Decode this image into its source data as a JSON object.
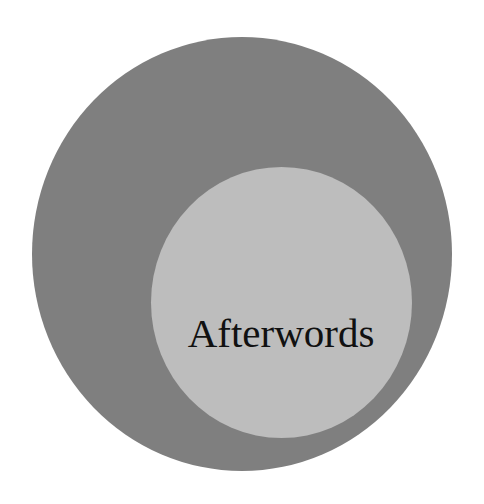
{
  "graphic": {
    "title": "Afterwords",
    "colors": {
      "background": "#ffffff",
      "outer_circle": "#7f7f7f",
      "inner_circle": "#bdbdbd",
      "text": "#111111"
    }
  }
}
